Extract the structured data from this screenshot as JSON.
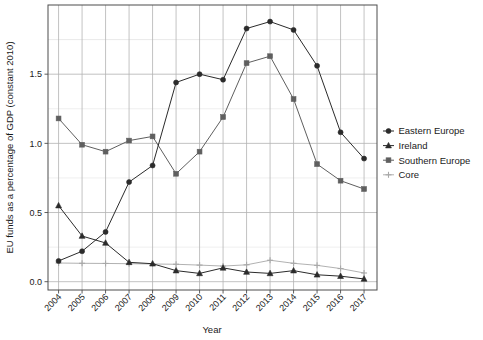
{
  "chart_data": {
    "type": "line",
    "title": "",
    "xlabel": "Year",
    "ylabel": "EU funds as a percentage of GDP (constant 2010)",
    "x": [
      2004,
      2005,
      2006,
      2007,
      2008,
      2009,
      2010,
      2011,
      2012,
      2013,
      2014,
      2015,
      2016,
      2017
    ],
    "categories": [
      "2004",
      "2005",
      "2006",
      "2007",
      "2008",
      "2009",
      "2010",
      "2011",
      "2012",
      "2013",
      "2014",
      "2015",
      "2016",
      "2017"
    ],
    "xtick_labels": [
      "2004",
      "2005",
      "2006",
      "2007",
      "2008",
      "2009",
      "2010",
      "2011",
      "2012",
      "2013",
      "2014",
      "2015",
      "2016",
      "2017"
    ],
    "ytick_labels": [
      "0.0",
      "0.5",
      "1.0",
      "1.5"
    ],
    "yticks": [
      0.0,
      0.5,
      1.0,
      1.5
    ],
    "ylim": [
      -0.06,
      2.0
    ],
    "xlim": [
      2003.55,
      2017.55
    ],
    "grid": true,
    "minor_grid": true,
    "legend_position": "right",
    "series": [
      {
        "name": "Eastern Europe",
        "marker": "circle",
        "color": "#2b2b2b",
        "values": [
          0.15,
          0.22,
          0.36,
          0.72,
          0.84,
          1.44,
          1.5,
          1.46,
          1.83,
          1.88,
          1.82,
          1.56,
          1.08,
          0.89
        ]
      },
      {
        "name": "Ireland",
        "marker": "triangle",
        "color": "#2b2b2b",
        "values": [
          0.55,
          0.33,
          0.28,
          0.14,
          0.13,
          0.08,
          0.06,
          0.1,
          0.07,
          0.06,
          0.08,
          0.05,
          0.04,
          0.02
        ]
      },
      {
        "name": "Southern Europe",
        "marker": "square",
        "color": "#5f5f5f",
        "values": [
          1.18,
          0.99,
          0.94,
          1.02,
          1.05,
          0.78,
          0.94,
          1.19,
          1.58,
          1.63,
          1.32,
          0.85,
          0.73,
          0.67
        ]
      },
      {
        "name": "Core",
        "marker": "plus",
        "color": "#a8a8a8",
        "values": [
          0.135,
          0.133,
          0.132,
          0.13,
          0.128,
          0.126,
          0.12,
          0.113,
          0.122,
          0.155,
          0.133,
          0.118,
          0.095,
          0.063
        ]
      }
    ]
  },
  "legend": {
    "items": [
      {
        "label": "Eastern Europe"
      },
      {
        "label": "Ireland"
      },
      {
        "label": "Southern Europe"
      },
      {
        "label": "Core"
      }
    ]
  },
  "colors": {
    "panel_background": "#ffffff",
    "panel_border": "#4d4d4d",
    "major_grid": "#b3b3b3",
    "minor_grid": "#e8e8e8",
    "text": "#1a1a1a"
  }
}
